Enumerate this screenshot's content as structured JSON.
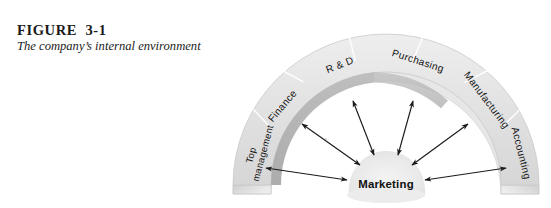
{
  "figure": {
    "number": "FIGURE  3-1",
    "subtitle": "The company’s internal environment"
  },
  "diagram": {
    "type": "semicircular-arc-hub-and-spoke",
    "center_node": {
      "label": "Marketing",
      "shape": "rounded-blob",
      "fill": "#ececec"
    },
    "arc": {
      "shape": "3d-semicircular-band",
      "top_face_color": "#e2e2e2",
      "inner_band_color": "#b2b2b2",
      "edge_color": "#f2f2f2",
      "outline_color": "#c9c9c9",
      "segment_divider_color": "#ffffff",
      "segment_count": 6
    },
    "segments": [
      {
        "label": "Top management",
        "two_line": true,
        "line1": "Top",
        "line2": "management"
      },
      {
        "label": "Finance",
        "two_line": false
      },
      {
        "label": "R & D",
        "two_line": false
      },
      {
        "label": "Purchasing",
        "two_line": false
      },
      {
        "label": "Manufacturing",
        "two_line": false
      },
      {
        "label": "Accounting",
        "two_line": false
      }
    ],
    "connectors": {
      "style": "double-headed-arrow",
      "count": 6,
      "color": "#1a1a1a",
      "description": "Each arc segment is linked to the Marketing hub by a two-way arrow"
    }
  },
  "colors": {
    "background": "#ffffff",
    "text": "#1b1b1b",
    "arc_light": "#e2e2e2",
    "arc_dark": "#b2b2b2",
    "arrow": "#1a1a1a"
  }
}
